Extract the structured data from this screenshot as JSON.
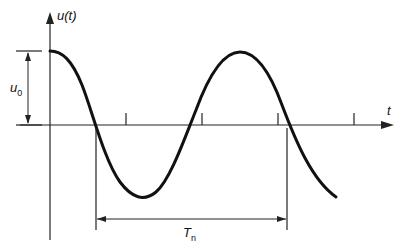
{
  "diagram": {
    "type": "damped-free-vibration-plot",
    "y_axis_label": "u(t)",
    "x_axis_label": "t",
    "amplitude_label": {
      "main": "u",
      "sub": "0"
    },
    "period_label": {
      "main": "T",
      "sub": "n"
    },
    "colors": {
      "line": "#111111",
      "background": "#ffffff"
    }
  }
}
